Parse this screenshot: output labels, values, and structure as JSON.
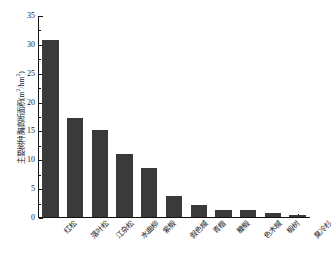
{
  "chart_data": {
    "type": "bar",
    "title": "",
    "xlabel": "",
    "ylabel": "主要树种胸高断面积(m2/hm2)",
    "ylabel_parts": {
      "prefix": "主要树种胸高断面积(m",
      "sup1": "2",
      "middle": "/hm",
      "sup2": "2",
      "suffix": ")"
    },
    "categories": [
      "红松",
      "落叶松",
      "江杂松",
      "水曲柳",
      "紫椴",
      "假色槭",
      "青楷",
      "糠椴",
      "色木槭",
      "椴树",
      "臭冷杉"
    ],
    "values": [
      30.6,
      17.1,
      15.0,
      11.0,
      8.5,
      3.6,
      2.1,
      1.3,
      1.2,
      0.7,
      0.4
    ],
    "ylim": [
      0,
      35
    ],
    "ytick_labels": [
      "0",
      "5",
      "10",
      "15",
      "20",
      "25",
      "30",
      "35"
    ],
    "ytick_values": [
      0,
      5,
      10,
      15,
      20,
      25,
      30,
      35
    ],
    "yminor_values": [
      2.5,
      7.5,
      12.5,
      17.5,
      22.5,
      27.5,
      32.5
    ],
    "grid": false,
    "legend": null,
    "bar_color": "#3a3a3a",
    "axis_color": "#111111",
    "background": "#ffffff"
  }
}
